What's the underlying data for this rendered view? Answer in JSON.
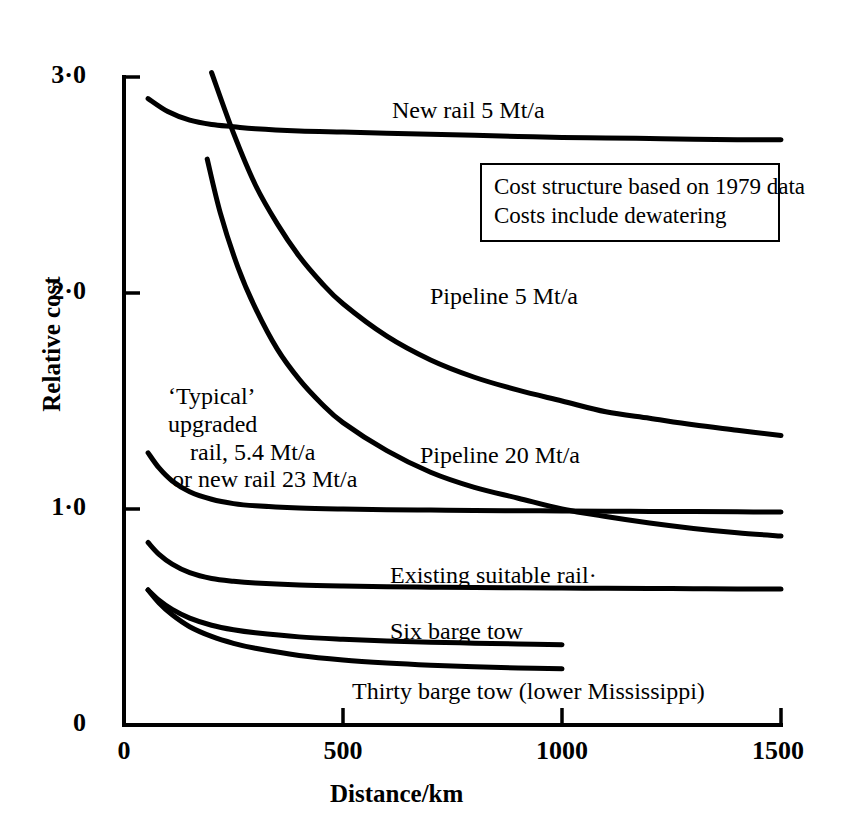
{
  "chart_data": {
    "type": "line",
    "title": "",
    "xlabel": "Distance/km",
    "ylabel": "Relative cost",
    "xlim": [
      0,
      1500
    ],
    "ylim": [
      0,
      3.0
    ],
    "xticks": [
      "0",
      "500",
      "1000",
      "1500"
    ],
    "xtick_values": [
      0,
      500,
      1000,
      1500
    ],
    "yticks": [
      "0",
      "1·0",
      "2·0",
      "3·0"
    ],
    "ytick_values": [
      0,
      1.0,
      2.0,
      3.0
    ],
    "grid": false,
    "legend": "inline-labels",
    "annotations": [
      "Cost structure based on 1979 data",
      "Costs include dewatering"
    ],
    "series": [
      {
        "name": "New rail 5 Mt/a",
        "label": "New rail 5 Mt/a",
        "x": [
          55,
          100,
          150,
          200,
          250,
          300,
          400,
          500,
          600,
          700,
          800,
          900,
          1000,
          1100,
          1200,
          1300,
          1400,
          1500
        ],
        "y": [
          2.9,
          2.84,
          2.8,
          2.78,
          2.77,
          2.76,
          2.75,
          2.745,
          2.74,
          2.735,
          2.73,
          2.725,
          2.72,
          2.718,
          2.715,
          2.712,
          2.71,
          2.71
        ]
      },
      {
        "name": "Pipeline 5 Mt/a",
        "label": "Pipeline 5 Mt/a",
        "x": [
          200,
          250,
          300,
          350,
          400,
          450,
          500,
          600,
          700,
          800,
          900,
          1000,
          1100,
          1200,
          1300,
          1400,
          1500
        ],
        "y": [
          3.02,
          2.74,
          2.5,
          2.32,
          2.17,
          2.05,
          1.95,
          1.8,
          1.69,
          1.61,
          1.55,
          1.5,
          1.45,
          1.42,
          1.39,
          1.365,
          1.34
        ]
      },
      {
        "name": "Pipeline 20 Mt/a",
        "label": "Pipeline 20 Mt/a",
        "x": [
          190,
          220,
          260,
          300,
          350,
          400,
          450,
          500,
          600,
          700,
          800,
          900,
          1000,
          1100,
          1200,
          1300,
          1400,
          1500
        ],
        "y": [
          2.62,
          2.37,
          2.12,
          1.93,
          1.74,
          1.6,
          1.49,
          1.4,
          1.27,
          1.17,
          1.1,
          1.05,
          1.0,
          0.965,
          0.935,
          0.91,
          0.89,
          0.875
        ]
      },
      {
        "name": "'Typical' upgraded rail, 5.4 Mt/a or new rail 23 Mt/a",
        "label": "'Typical' upgraded rail, 5.4 Mt/a or new rail 23 Mt/a",
        "x": [
          55,
          80,
          110,
          150,
          200,
          250,
          300,
          400,
          500,
          600,
          700,
          800,
          900,
          1000,
          1100,
          1200,
          1300,
          1400,
          1500
        ],
        "y": [
          1.26,
          1.19,
          1.13,
          1.08,
          1.045,
          1.025,
          1.015,
          1.005,
          1.0,
          0.997,
          0.995,
          0.993,
          0.992,
          0.991,
          0.99,
          0.989,
          0.988,
          0.987,
          0.986
        ]
      },
      {
        "name": "Existing suitable rail",
        "label": "Existing suitable rail·",
        "x": [
          55,
          80,
          110,
          150,
          200,
          250,
          300,
          400,
          500,
          600,
          700,
          800,
          900,
          1000,
          1100,
          1200,
          1300,
          1400,
          1500
        ],
        "y": [
          0.845,
          0.79,
          0.745,
          0.705,
          0.678,
          0.665,
          0.657,
          0.648,
          0.643,
          0.64,
          0.638,
          0.636,
          0.635,
          0.634,
          0.633,
          0.632,
          0.631,
          0.63,
          0.63
        ]
      },
      {
        "name": "Six barge tow",
        "label": "Six barge tow",
        "x": [
          55,
          80,
          110,
          150,
          200,
          250,
          300,
          400,
          500,
          600,
          700,
          800,
          900,
          1000
        ],
        "y": [
          0.625,
          0.578,
          0.535,
          0.495,
          0.462,
          0.441,
          0.427,
          0.408,
          0.397,
          0.389,
          0.383,
          0.379,
          0.375,
          0.372
        ]
      },
      {
        "name": "Thirty barge tow (lower Mississippi)",
        "label": "Thirty barge tow (lower Mississippi)",
        "x": [
          55,
          80,
          110,
          150,
          200,
          250,
          300,
          400,
          500,
          600,
          700,
          800,
          900,
          1000
        ],
        "y": [
          0.625,
          0.565,
          0.51,
          0.455,
          0.41,
          0.378,
          0.355,
          0.322,
          0.301,
          0.287,
          0.277,
          0.27,
          0.264,
          0.26
        ]
      }
    ]
  },
  "axes": {
    "y_title": "Relative cost",
    "x_title": "Distance/km",
    "y_tick_labels": [
      "3·0",
      "2·0",
      "1·0",
      "0"
    ],
    "x_tick_labels": [
      "0",
      "500",
      "1000",
      "1500"
    ]
  },
  "labels": {
    "new_rail": "New rail 5 Mt/a",
    "pipeline5": "Pipeline 5 Mt/a",
    "pipeline20": "Pipeline 20 Mt/a",
    "typical_line1": "‘Typical’",
    "typical_line2": "upgraded",
    "typical_line3": "rail, 5.4 Mt/a",
    "typical_line4": "or new rail 23 Mt/a",
    "existing_rail": "Existing suitable rail·",
    "six_barge": "Six barge tow",
    "thirty_barge": "Thirty barge tow (lower Mississippi)"
  },
  "note_box": {
    "line1": "Cost structure based on 1979 data",
    "line2": "Costs include dewatering"
  },
  "style": {
    "ink": "#000000",
    "paper": "#ffffff"
  }
}
